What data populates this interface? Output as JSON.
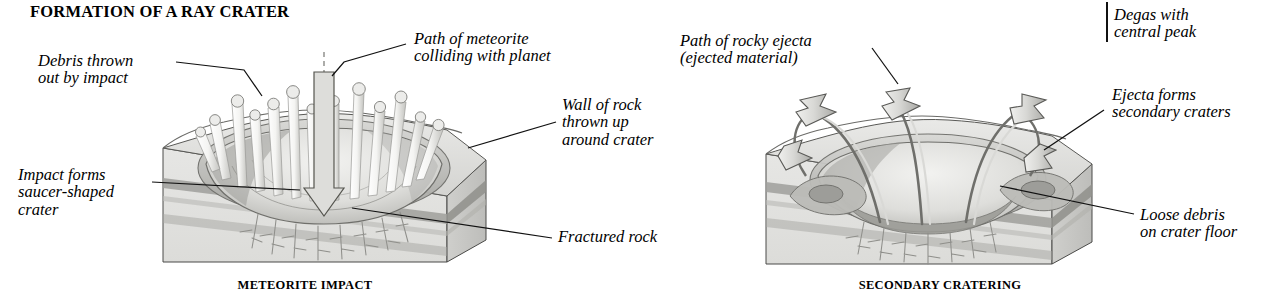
{
  "figure": {
    "title": "FORMATION OF A RAY CRATER",
    "panels": [
      {
        "id": "meteorite-impact",
        "caption": "METEORITE IMPACT",
        "labels": [
          {
            "id": "debris-thrown-out",
            "lines": "Debris thrown\nout by impact"
          },
          {
            "id": "path-of-meteorite",
            "lines": "Path of meteorite\ncolliding with planet"
          },
          {
            "id": "wall-of-rock",
            "lines": "Wall of rock\nthrown up\naround crater"
          },
          {
            "id": "impact-forms-crater",
            "lines": "Impact forms\nsaucer-shaped\ncrater"
          },
          {
            "id": "fractured-rock",
            "lines": "Fractured rock"
          }
        ]
      },
      {
        "id": "secondary-cratering",
        "caption": "SECONDARY CRATERING",
        "labels": [
          {
            "id": "path-of-rocky-ejecta",
            "lines": "Path of rocky ejecta\n(ejected material)"
          },
          {
            "id": "degas-central-peak",
            "lines": "Degas with\ncentral peak"
          },
          {
            "id": "ejecta-secondary",
            "lines": "Ejecta forms\nsecondary craters"
          },
          {
            "id": "loose-debris",
            "lines": "Loose debris\non crater floor"
          }
        ]
      }
    ],
    "colors": {
      "ink": "#111111",
      "paper": "#ffffff",
      "rock_light": "#e3e3e1",
      "rock_mid": "#c9c9c6",
      "rock_dark": "#a8a8a4",
      "stratum_dark": "#9a9a96",
      "crater_floor": "#ededeb",
      "ejecta_arrow": "#d2d2cf"
    }
  }
}
